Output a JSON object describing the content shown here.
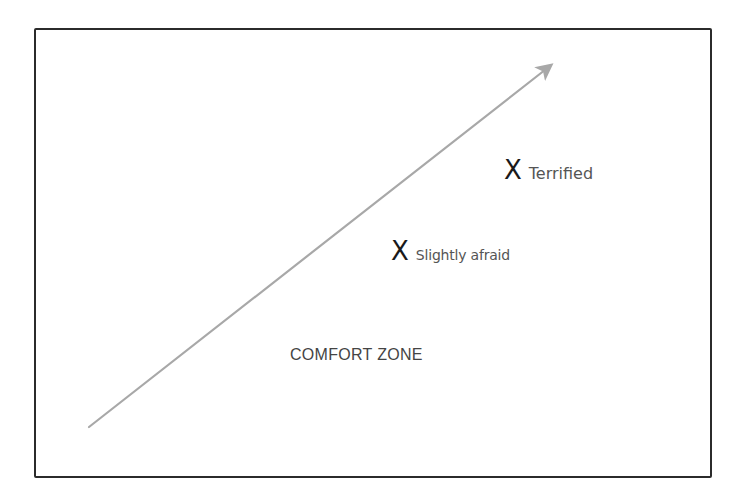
{
  "diagram": {
    "title": "",
    "comfort_zone_label": "COMFORT ZONE",
    "markers": [
      {
        "symbol": "X",
        "label": "Terrified"
      },
      {
        "symbol": "X",
        "label": "Slightly afraid"
      }
    ],
    "arrow": {
      "from": [
        89,
        427
      ],
      "to": [
        553,
        63
      ],
      "color": "#a8a8a8",
      "meaning": "increasing-fear-direction"
    },
    "colors": {
      "frame_border": "#2b2b2b",
      "x_mark": "#1a1a1a",
      "label_text": "#555555",
      "comfort_zone_text": "#444444",
      "arrow": "#a8a8a8"
    }
  }
}
